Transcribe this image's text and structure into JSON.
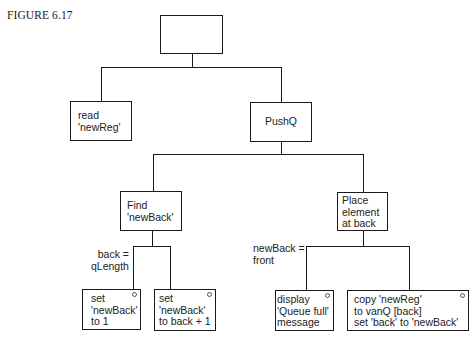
{
  "figure": {
    "label": "FIGURE 6.17"
  },
  "nodes": {
    "root": {
      "text": ""
    },
    "read": {
      "text": "read\n'newReg'"
    },
    "pushq": {
      "text": "PushQ"
    },
    "find": {
      "text": "Find\n'newBack'"
    },
    "place": {
      "text": "Place\nelement\nat back"
    },
    "set1": {
      "text": "set\n'newBack'\nto 1",
      "selection": true
    },
    "set2": {
      "text": "set\n'newBack'\nto back + 1",
      "selection": true
    },
    "display": {
      "text": "display\n'Queue full'\nmessage",
      "selection": true
    },
    "copy": {
      "text": "copy 'newReg'\nto vanQ [back]\nset 'back' to 'newBack'",
      "selection": true
    }
  },
  "conditions": {
    "find_cond": "back =\nqLength",
    "place_cond": "newBack =\nfront"
  },
  "colors": {
    "line": "#1a1a1a",
    "text": "#222222",
    "background": "#ffffff"
  }
}
